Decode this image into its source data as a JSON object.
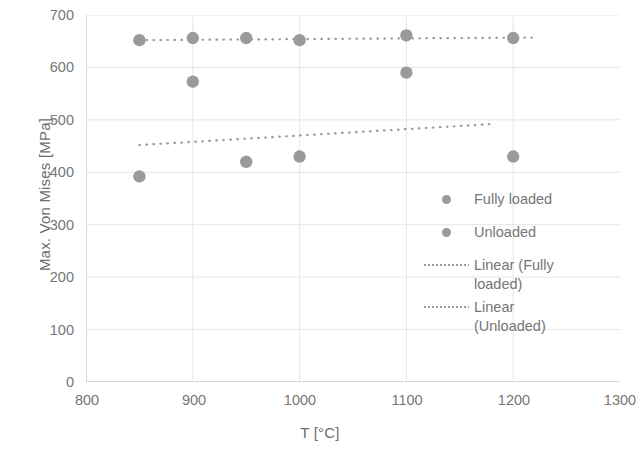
{
  "chart_data": {
    "type": "scatter",
    "title": "",
    "xlabel": "T [°C]",
    "ylabel": "Max. Von Mises [MPa]",
    "xlim": [
      800,
      1300
    ],
    "ylim": [
      0,
      700
    ],
    "xticks": [
      800,
      900,
      1000,
      1100,
      1200,
      1300
    ],
    "yticks": [
      0,
      100,
      200,
      300,
      400,
      500,
      600,
      700
    ],
    "grid": true,
    "grid_axis": "y",
    "legend_position": "right-inside",
    "marker_color": "#9a9a9a",
    "grid_color": "#e6e6e6",
    "axis_color": "#d9d9d9",
    "text_color": "#767676",
    "series": [
      {
        "name": "Fully loaded",
        "type": "scatter",
        "marker": "circle",
        "color": "#9a9a9a",
        "x": [
          850,
          900,
          950,
          1000,
          1100,
          1200
        ],
        "values": [
          652,
          656,
          656,
          652,
          661,
          656
        ]
      },
      {
        "name": "Unloaded",
        "type": "scatter",
        "marker": "circle",
        "color": "#9a9a9a",
        "x": [
          850,
          900,
          950,
          1000,
          1100,
          1200
        ],
        "values": [
          392,
          573,
          420,
          430,
          590,
          430
        ]
      },
      {
        "name": "Linear (Fully loaded)",
        "type": "trendline",
        "style": "dotted",
        "color": "#9a9a9a",
        "x": [
          850,
          1220
        ],
        "values": [
          652,
          657
        ]
      },
      {
        "name": "Linear (Unloaded)",
        "type": "trendline",
        "style": "dotted",
        "color": "#9a9a9a",
        "x": [
          850,
          1180
        ],
        "values": [
          452,
          492
        ]
      }
    ]
  },
  "axes": {
    "y_title": "Max. Von Mises [MPa]",
    "x_title": "T [°C]",
    "y_tick_labels": [
      "700",
      "600",
      "500",
      "400",
      "300",
      "200",
      "100",
      "0"
    ],
    "x_tick_labels": [
      "800",
      "900",
      "1000",
      "1100",
      "1200",
      "1300"
    ]
  },
  "legend": {
    "items": [
      {
        "label": "Fully loaded",
        "key": "marker-dot"
      },
      {
        "label": "Unloaded",
        "key": "marker-dot"
      },
      {
        "label": "Linear (Fully\nloaded)",
        "key": "dotted-line"
      },
      {
        "label": "Linear\n(Unloaded)",
        "key": "dotted-line"
      }
    ]
  }
}
